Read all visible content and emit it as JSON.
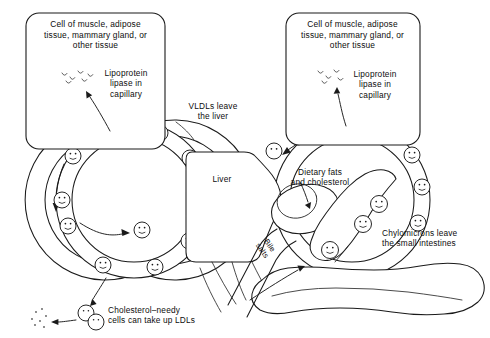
{
  "figure": {
    "background_color": "#ffffff",
    "line_color": "#1a1a1a",
    "text_color": "#0d0d0d"
  },
  "cell_box_left": {
    "name": "target-tissue-cell-left",
    "title": "Cell of muscle, adipose\ntissue, mammary gland, or\nother tissue",
    "enzyme_label": "Lipoprotein\nlipase in\ncapillary",
    "enzyme_icon": "squiggle-enzyme-icon"
  },
  "cell_box_right": {
    "name": "target-tissue-cell-right",
    "title": "Cell of muscle, adipose\ntissue, mammary gland, or\nother tissue",
    "enzyme_label": "Lipoprotein\nlipase in\ncapillary",
    "enzyme_icon": "squiggle-enzyme-icon"
  },
  "annotations": {
    "vldl": "VLDLs leave\nthe liver",
    "liver": "Liver",
    "dietary": "Dietary fats\nand cholesterol",
    "chylomicrons": "Chylomicrons leave\nthe small intestines",
    "bile": "Bile\nsalts",
    "ldl_uptake": "Cholesterol–needy\ncells can take up LDLs"
  },
  "organs": [
    {
      "name": "liver",
      "label": "Liver"
    },
    {
      "name": "small-intestine",
      "label": ""
    },
    {
      "name": "gallbladder",
      "label": ""
    }
  ],
  "vessels": [
    {
      "name": "vldl-circulation-loop",
      "flow_direction": "counterclockwise"
    },
    {
      "name": "chylomicron-circulation-loop",
      "flow_direction": "counterclockwise"
    }
  ],
  "particles": {
    "icon": "lipoprotein-particle-icon",
    "left_loop_count": 9,
    "right_loop_count": 9,
    "interior_count": 1,
    "ldl_escape_count": 2
  }
}
